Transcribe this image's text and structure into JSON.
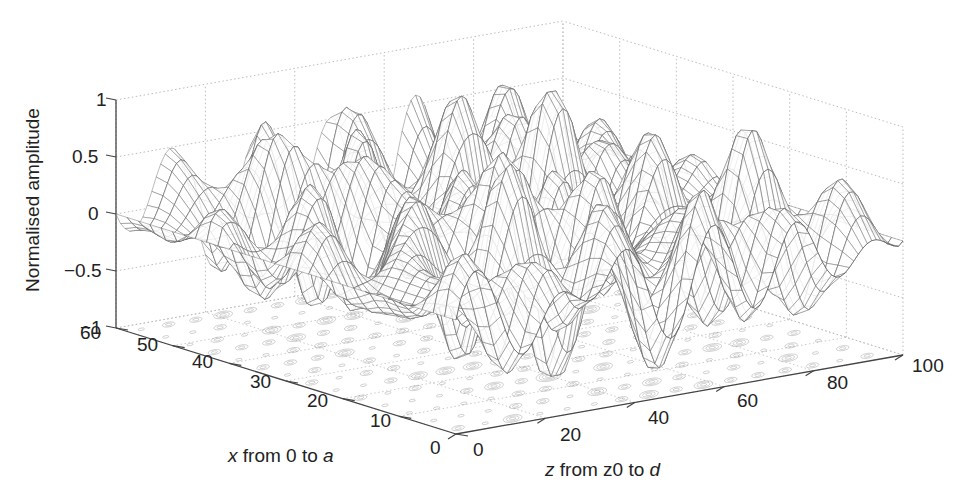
{
  "chart_data": {
    "type": "surface3d",
    "title": "",
    "zlabel": "Normalised amplitude",
    "xlabel": {
      "var": "x",
      "text": " from 0 to ",
      "end": "a"
    },
    "ylabel": {
      "var": "z",
      "text": " from z0 to ",
      "end": "d"
    },
    "x_axis": {
      "range": [
        0,
        60
      ],
      "ticks": [
        0,
        10,
        20,
        30,
        40,
        50,
        60
      ]
    },
    "z_axis": {
      "range": [
        0,
        100
      ],
      "ticks": [
        0,
        20,
        40,
        60,
        80,
        100
      ]
    },
    "amp_axis": {
      "range": [
        -1,
        1
      ],
      "ticks": [
        "1",
        "0.5",
        "0",
        "−0.5",
        "−1"
      ],
      "tick_values": [
        1,
        0.5,
        0,
        -0.5,
        -1
      ]
    },
    "grid": true,
    "style": "wireframe mesh with contour projection on floor",
    "colors": {
      "mesh": "#6a6a6a",
      "mesh_dark": "#3a3a3a",
      "contour": "#9a9a9a",
      "grid": "#bdbdbd",
      "axis": "#444444"
    },
    "surface_description": "Oscillatory standing-wave pattern, amplitude 0 at z boundaries (z=0 and z=100), peaks near +1 and troughs near -1 across interior"
  },
  "labels": {
    "zlabel": "Normalised amplitude",
    "x_var": "x",
    "x_mid": " from 0 to ",
    "x_end": "a",
    "z_var": "z",
    "z_mid": " from z0 to ",
    "z_end": "d"
  }
}
